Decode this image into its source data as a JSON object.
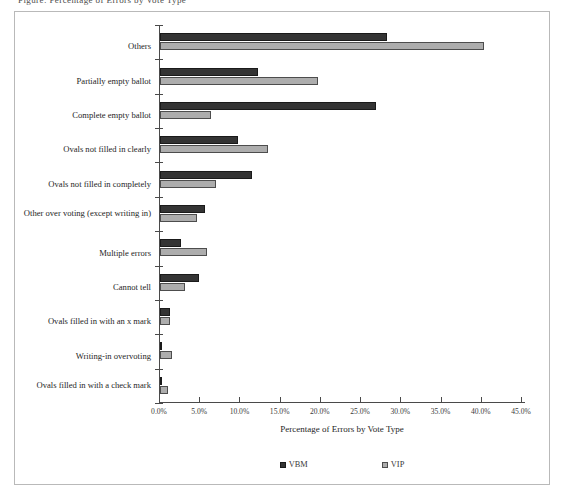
{
  "page": {
    "top_fragment": "Figure: Percentage of Errors by Vote Type"
  },
  "legend": {
    "position": "bottom-center",
    "items": [
      {
        "label": "VBM",
        "color": "#343434",
        "icon": "legend-swatch-icon"
      },
      {
        "label": "VIP",
        "color": "#adadad",
        "icon": "legend-swatch-icon"
      }
    ]
  },
  "axis": {
    "x_title": "Percentage of Errors by Vote Type",
    "ticks": [
      "0.0%",
      "5.0%",
      "10.0%",
      "15.0%",
      "20.0%",
      "25.0%",
      "30.0%",
      "35.0%",
      "40.0%",
      "45.0%"
    ]
  },
  "chart_data": {
    "type": "bar",
    "orientation": "horizontal",
    "title": "",
    "xlabel": "Percentage of Errors by Vote Type",
    "ylabel": "",
    "xlim": [
      0,
      45
    ],
    "xtick_step": 5,
    "grid": false,
    "legend_position": "bottom",
    "categories": [
      "Others",
      "Partially empty ballot",
      "Complete empty ballot",
      "Ovals not filled in clearly",
      "Ovals not filled in completely",
      "Other over voting (except writing in)",
      "Multiple errors",
      "Cannot tell",
      "Ovals filled in with an x mark",
      "Writing-in overvoting",
      "Ovals filled in with a check mark"
    ],
    "series": [
      {
        "name": "VBM",
        "color": "#343434",
        "values": [
          28.2,
          12.2,
          26.8,
          9.7,
          11.4,
          5.6,
          2.6,
          4.8,
          1.3,
          0.1,
          0.1
        ]
      },
      {
        "name": "VIP",
        "color": "#adadad",
        "values": [
          40.3,
          19.6,
          6.3,
          13.4,
          6.9,
          4.6,
          5.8,
          3.1,
          1.3,
          1.5,
          1.0
        ]
      }
    ]
  }
}
